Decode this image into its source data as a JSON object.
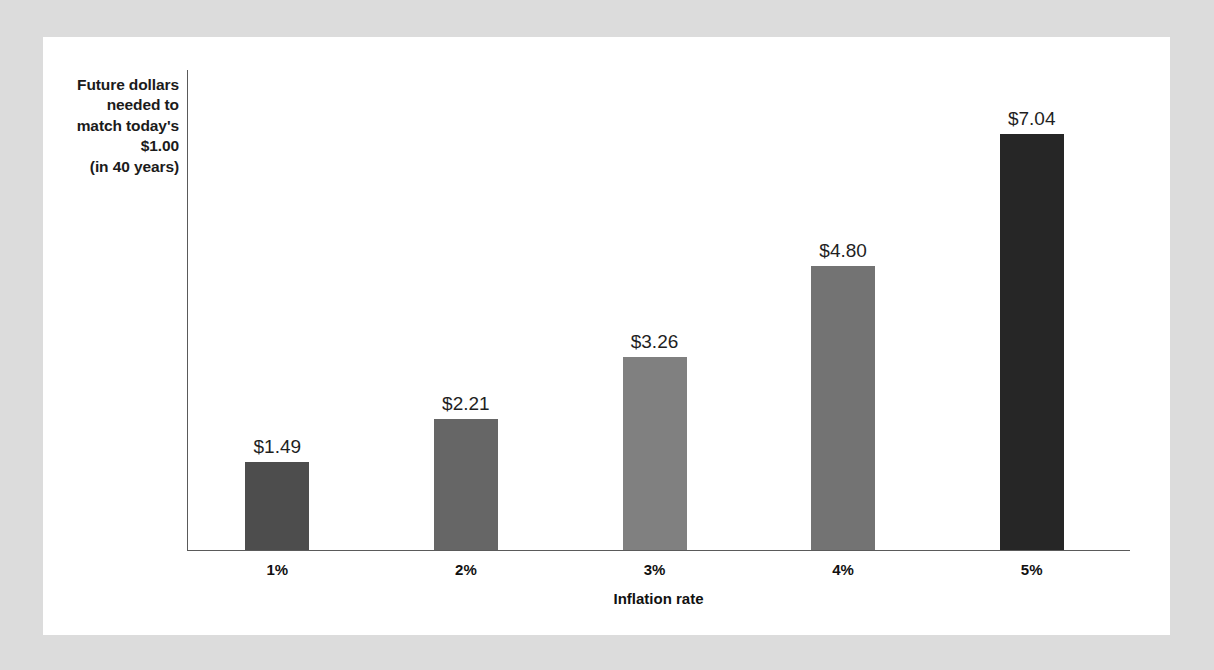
{
  "chart_data": {
    "type": "bar",
    "title": "",
    "subtitle": "",
    "xlabel": "Inflation rate",
    "ylabel": "Future dollars needed to match today's $1.00 (in 40 years)",
    "ylabel_lines": [
      "Future dollars",
      "needed to",
      "match today's",
      "$1.00",
      "(in 40 years)"
    ],
    "categories": [
      "1%",
      "2%",
      "3%",
      "4%",
      "5%"
    ],
    "values": [
      1.49,
      2.21,
      3.26,
      4.8,
      7.04
    ],
    "value_labels": [
      "$1.49",
      "$2.21",
      "$3.26",
      "$4.80",
      "$7.04"
    ],
    "bar_colors": [
      "#4d4d4d",
      "#666666",
      "#808080",
      "#737373",
      "#262626"
    ],
    "ylim": [
      0,
      8.15
    ],
    "grid": false,
    "legend": null,
    "y_tick_labels": [],
    "axis_color": "#5a5a5a"
  },
  "figure": {
    "background_color": "#dcdcdc",
    "card_color": "#ffffff"
  }
}
